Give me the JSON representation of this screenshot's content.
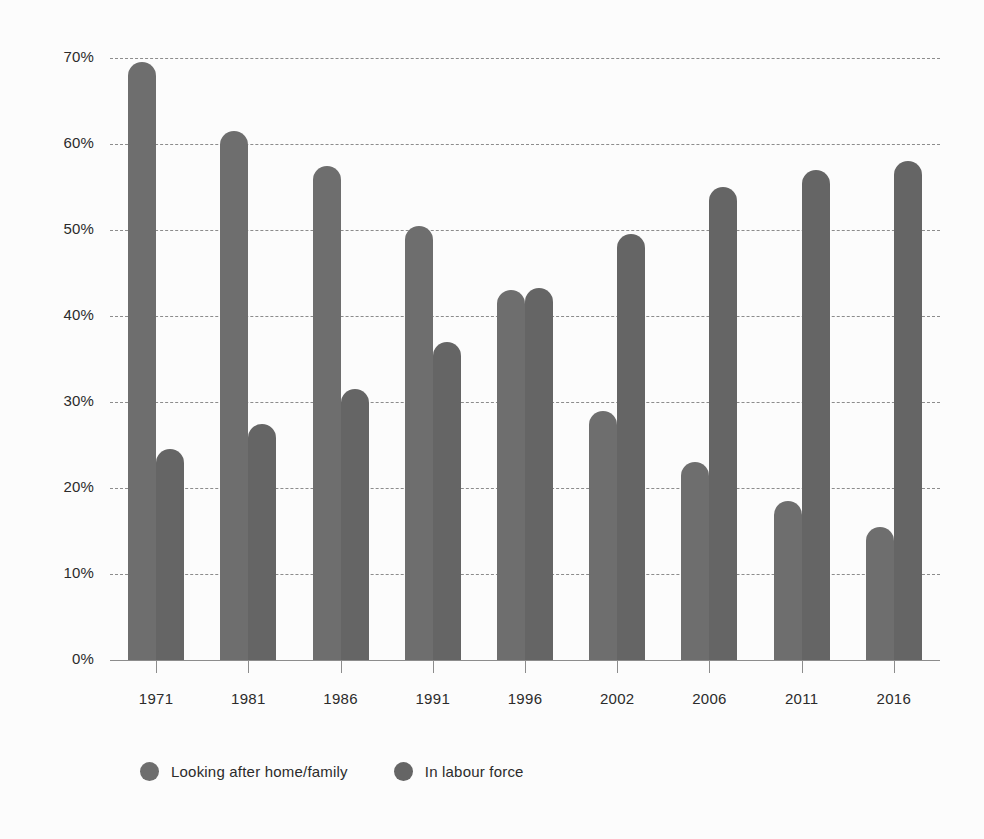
{
  "chart_data": {
    "type": "bar",
    "title": "",
    "subtitle": "",
    "xlabel": "",
    "ylabel": "",
    "categories": [
      "1971",
      "1981",
      "1986",
      "1991",
      "1996",
      "2002",
      "2006",
      "2011",
      "2016"
    ],
    "series": [
      {
        "name": "Looking after home/family",
        "color": "#6e6e6e",
        "values": [
          69.5,
          61.5,
          57.5,
          50.5,
          43.0,
          29.0,
          23.0,
          18.5,
          15.5
        ]
      },
      {
        "name": "In labour force",
        "color": "#656565",
        "values": [
          24.5,
          27.5,
          31.5,
          37.0,
          43.2,
          49.5,
          55.0,
          57.0,
          58.0
        ]
      }
    ],
    "ylim": [
      0,
      70
    ],
    "ytick_values": [
      0,
      10,
      20,
      30,
      40,
      50,
      60,
      70
    ],
    "ytick_labels": [
      "0%",
      "10%",
      "20%",
      "30%",
      "40%",
      "50%",
      "60%",
      "70%"
    ],
    "grid": true,
    "grid_style": "dashed-horizontal",
    "legend_position": "bottom-left",
    "background_color": "#fcfcfc",
    "axis_color": "#8c8c8c"
  }
}
